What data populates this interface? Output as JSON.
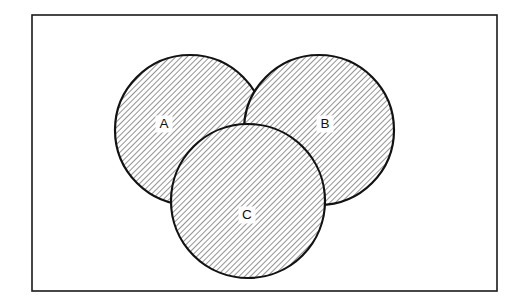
{
  "figure": {
    "kind": "venn-diagram",
    "title": "",
    "canvas": {
      "width": 522,
      "height": 308
    },
    "background_color": "#ffffff"
  },
  "frame": {
    "name": "diagram-border",
    "x": 32,
    "y": 15,
    "width": 465,
    "height": 276,
    "stroke_color": "#1a1a1a",
    "fill_color": "#ffffff"
  },
  "style": {
    "hatch_angle_degrees": 45,
    "hatch_direction": "backslash",
    "hatch_spacing_px": 4,
    "hatch_color": "#3a3a3a",
    "hatch_stroke_width": 1.1,
    "circle_outline_color": "#121212",
    "circle_outline_width": 2.2,
    "label_font_size_px": 13.5,
    "label_text_color": "#111111",
    "label_chip_color": "#ffffff"
  },
  "sets": [
    {
      "id": "A",
      "label": "A",
      "cx": 190,
      "cy": 130,
      "r": 75,
      "label_x": 164,
      "label_y": 124,
      "label_chip_w": 17,
      "label_chip_h": 17
    },
    {
      "id": "B",
      "label": "B",
      "cx": 319,
      "cy": 130,
      "r": 75,
      "label_x": 325,
      "label_y": 124,
      "label_chip_w": 17,
      "label_chip_h": 17
    },
    {
      "id": "C",
      "label": "C",
      "cx": 248,
      "cy": 201,
      "r": 77,
      "label_x": 247,
      "label_y": 215,
      "label_chip_w": 17,
      "label_chip_h": 17
    }
  ],
  "chart_data": {
    "type": "venn",
    "title": "",
    "xlabel": "",
    "ylabel": "",
    "set_labels": [
      "A",
      "B",
      "C"
    ],
    "set_count": 3,
    "regions_shaded": "all"
  }
}
